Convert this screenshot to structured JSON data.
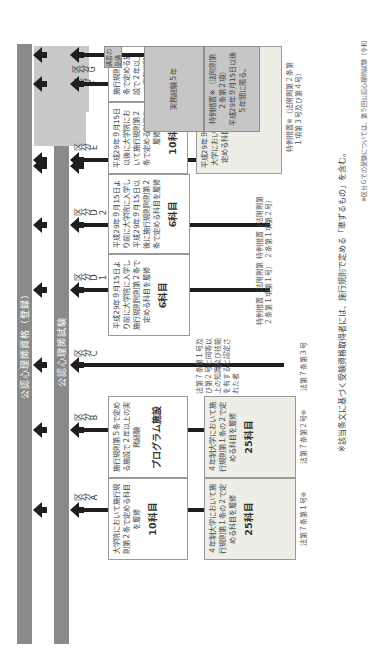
{
  "orientation": "rotated-90deg-clockwise",
  "bands": {
    "qualification": "公認心理師資格（登録）",
    "exam": "公認心理師試験"
  },
  "columns": [
    {
      "id": "A",
      "label": "区分A",
      "graduate_box": {
        "text": "大学院において施行規則第２条で定める科目を履修",
        "subjects": "10科目"
      },
      "undergrad_box": {
        "text": "４年制大学において施行規則第１条の２で定める科目を履修",
        "subjects": "25科目"
      },
      "basis": "法第７条第１号※"
    },
    {
      "id": "B",
      "label": "区分B",
      "graduate_box": {
        "text": "施行規則第５条で定める施設で２年以上の実務経験",
        "program": "プログラム施設"
      },
      "undergrad_box": {
        "text": "４年制大学において施行規則第１条の２で定める科目を履修",
        "subjects": "25科目"
      },
      "basis": "法第７条第２号※"
    },
    {
      "id": "C",
      "label": "区分C",
      "criteria_note": "法第７条第１号及び第２号と同等以上の知識及び技能を有すると認定された者",
      "basis": "法第７条第３号"
    },
    {
      "id": "D1",
      "label": "区分D1",
      "box": {
        "text": "平成29年９月15日より前に大学院に入学し施行規則附則第２条で定める科目を履修",
        "subjects": "6科目"
      },
      "basis": "特例措置（法附則第２条第１項第１号）"
    },
    {
      "id": "D2",
      "label": "区分D2",
      "box": {
        "text": "平成29年９月15日より前に大学院に入学し平成29年９月15日以後に施行規則附則第２条で定める科目を履修",
        "subjects": "6科目"
      },
      "basis": "特例措置（法附則第２条第１項第２号）"
    },
    {
      "id": "E",
      "label": "区分E",
      "box": {
        "text": "平成29年９月15日以後に大学院において施行規則第２条で定める科目を履修",
        "subjects": "10科目"
      }
    },
    {
      "id": "F",
      "label": "区分F",
      "box": {
        "text": "施行規則第５条で定める施設で２年以上の実務経験",
        "program": "プログラム施設"
      }
    },
    {
      "id": "G",
      "label": "区分G",
      "course_box": "講習の受講",
      "experience_box": "実務経験５年",
      "basis": "特例措置※（法附則第２条第２項）",
      "limit": "平成29年９月15日以後５年間に限る。"
    }
  ],
  "shared_undergrad_EF": {
    "text": "平成29年９月15日より前に、４年制大学において施行規則附則第３条で定める科目を履修（又は履修中）",
    "subjects": "12科目",
    "basis": "特例措置※（法附則第２条第１項第３号及び第４号）"
  },
  "footnote": "※該当条文に基づく受験資格取得者には、施行規則で定める「準ずるもの」を含む。",
  "side_note": "※区分Ｇでの受験については、第５回公認心理師試験（令和",
  "colors": {
    "band": "#8a8a8a",
    "g_zone": "#c9c9c9",
    "box_shaded": "#eeeee6",
    "arrow": "#1e1e1e"
  }
}
